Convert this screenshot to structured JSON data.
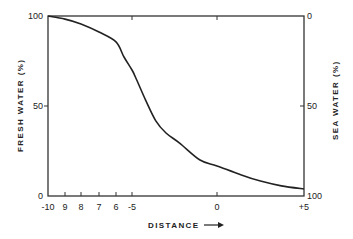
{
  "chart_data": {
    "type": "line",
    "title": "",
    "xlabel": "DISTANCE",
    "xlabel_arrow": "→",
    "ylabel": "FRESH WATER (%)",
    "ylabel_right": "SEA WATER (%)",
    "xlim": [
      -10,
      5
    ],
    "ylim": [
      0,
      100
    ],
    "ylim_right": [
      100,
      0
    ],
    "grid": false,
    "legend": null,
    "x_ticks": [
      {
        "value": -10,
        "label": "-10"
      },
      {
        "value": -9,
        "label": "9"
      },
      {
        "value": -8,
        "label": "8"
      },
      {
        "value": -7,
        "label": "7"
      },
      {
        "value": -6,
        "label": "6"
      },
      {
        "value": -5,
        "label": "-5"
      },
      {
        "value": 0,
        "label": "0"
      },
      {
        "value": 5,
        "label": "+5"
      }
    ],
    "y_ticks_left": [
      {
        "value": 0,
        "label": "0"
      },
      {
        "value": 50,
        "label": "50"
      },
      {
        "value": 100,
        "label": "100"
      }
    ],
    "y_ticks_right": [
      {
        "value": 100,
        "label": "0"
      },
      {
        "value": 50,
        "label": "50"
      },
      {
        "value": 0,
        "label": "100"
      }
    ],
    "series": [
      {
        "name": "Fresh water",
        "x": [
          -10,
          -9,
          -8,
          -7,
          -6,
          -5.5,
          -5,
          -4.8,
          -4.2,
          -3.6,
          -3,
          -2.2,
          -1,
          0,
          1.4,
          2.5,
          3.7,
          5
        ],
        "values": [
          100,
          98.3,
          95.6,
          91.1,
          85.6,
          77.2,
          70,
          66.1,
          53.3,
          41.7,
          35,
          29.4,
          20,
          16.7,
          11.7,
          8.3,
          5.6,
          3.9
        ]
      }
    ]
  },
  "labels": {
    "x_title": "DISTANCE",
    "y_left_title": "FRESH WATER (%)",
    "y_right_title": "SEA WATER (%)"
  }
}
